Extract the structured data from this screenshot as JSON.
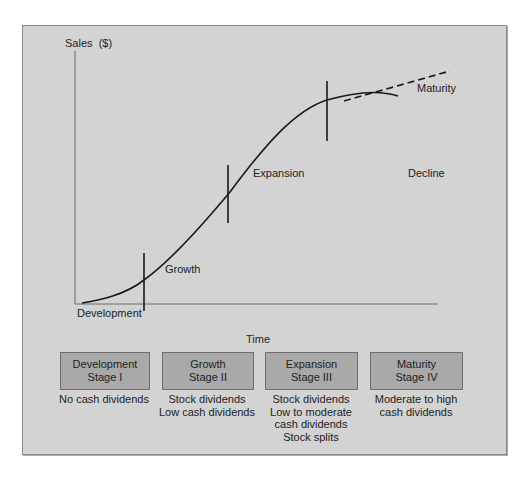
{
  "diagram": {
    "y_axis_label": "Sales  ($)",
    "x_axis_label": "Time",
    "curve_labels": {
      "development": "Development",
      "growth": "Growth",
      "expansion": "Expansion",
      "maturity": "Maturity",
      "decline": "Decline"
    },
    "colors": {
      "panel_bg": "#d3d3d3",
      "panel_border": "#8a8a8a",
      "stage_box_bg": "#a9a9a9",
      "line": "#1a1a1a"
    }
  },
  "stages": [
    {
      "name": "Development",
      "stage": "Stage I",
      "dividends": [
        "No cash dividends"
      ]
    },
    {
      "name": "Growth",
      "stage": "Stage II",
      "dividends": [
        "Stock dividends",
        "Low cash dividends"
      ]
    },
    {
      "name": "Expansion",
      "stage": "Stage III",
      "dividends": [
        "Stock dividends",
        "Low to moderate",
        "cash dividends",
        "Stock splits"
      ]
    },
    {
      "name": "Maturity",
      "stage": "Stage IV",
      "dividends": [
        "Moderate to high",
        "cash dividends"
      ]
    }
  ]
}
